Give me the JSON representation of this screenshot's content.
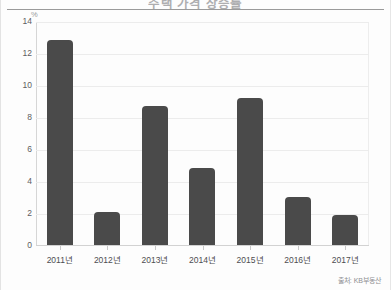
{
  "figure": {
    "title": "주택 가격 상승률",
    "unit_label": "%",
    "source": "출처: KB부동산",
    "bar_color": "#4a4a4a",
    "grid_color": "#ececec",
    "axis_color": "#d2d2d2"
  },
  "chart_data": {
    "type": "bar",
    "title": "주택 가격 상승률",
    "xlabel": "",
    "ylabel": "%",
    "categories": [
      "2011년",
      "2012년",
      "2013년",
      "2014년",
      "2015년",
      "2016년",
      "2017년"
    ],
    "values": [
      12.9,
      2.05,
      8.7,
      4.85,
      9.25,
      3.0,
      1.9
    ],
    "ylim": [
      0,
      14
    ],
    "yticks": [
      0,
      2,
      4,
      6,
      8,
      10,
      12,
      14
    ],
    "ytick_labels": [
      "0",
      "2",
      "4",
      "6",
      "8",
      "10",
      "12",
      "14"
    ],
    "grid": true,
    "grid_axis": "y",
    "legend": false,
    "legend_position": "none",
    "annotations": [
      "출처: KB부동산"
    ]
  }
}
